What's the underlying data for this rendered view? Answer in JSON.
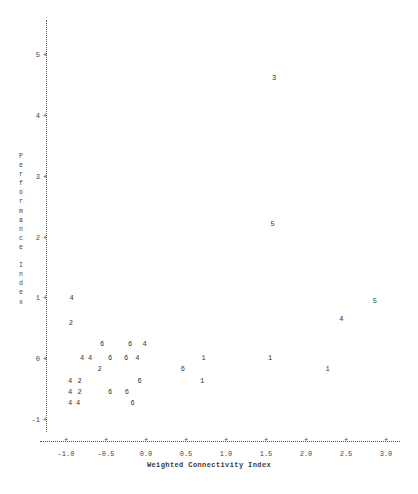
{
  "chart_data": {
    "type": "scatter",
    "title": "",
    "xlabel": "Weighted Connectivity Index",
    "ylabel": "Performance Index",
    "ylabel_chars": [
      "P",
      "e",
      "r",
      "f",
      "o",
      "r",
      "m",
      "a",
      "n",
      "c",
      "e",
      " ",
      "I",
      "n",
      "d",
      "e",
      "x"
    ],
    "xlim": [
      -1.25,
      3.15
    ],
    "ylim": [
      -1.35,
      5.55
    ],
    "xticks": [
      "-1.0",
      "-0.5",
      "0.0",
      "0.5",
      "1.0",
      "1.5",
      "2.0",
      "2.5",
      "3.0"
    ],
    "xtick_values": [
      -1.0,
      -0.5,
      0.0,
      0.5,
      1.0,
      1.5,
      2.0,
      2.5,
      3.0
    ],
    "yticks": [
      "5",
      "4",
      "3",
      "2",
      "1",
      "0",
      "-1"
    ],
    "ytick_values": [
      5,
      4,
      3,
      2,
      1,
      0,
      -1
    ],
    "tick_glyph": "+",
    "grid": false,
    "legend": null,
    "note": "Character-cell scatter plot; each plotted glyph is a digit giving the count of observations overplotted at that cell.",
    "points": [
      {
        "x": 1.6,
        "y": 4.62,
        "label": "3"
      },
      {
        "x": 1.58,
        "y": 2.22,
        "label": "5"
      },
      {
        "x": -0.93,
        "y": 1.01,
        "label": "4"
      },
      {
        "x": 2.86,
        "y": 0.95,
        "label": "5"
      },
      {
        "x": 2.44,
        "y": 0.66,
        "label": "4"
      },
      {
        "x": -0.94,
        "y": 0.6,
        "label": "2"
      },
      {
        "x": -0.55,
        "y": 0.25,
        "label": "6"
      },
      {
        "x": -0.2,
        "y": 0.25,
        "label": "6"
      },
      {
        "x": -0.02,
        "y": 0.25,
        "label": "4"
      },
      {
        "x": -0.8,
        "y": 0.02,
        "label": "4"
      },
      {
        "x": -0.7,
        "y": 0.02,
        "label": "4"
      },
      {
        "x": -0.45,
        "y": 0.02,
        "label": "6"
      },
      {
        "x": -0.25,
        "y": 0.02,
        "label": "6"
      },
      {
        "x": -0.11,
        "y": 0.02,
        "label": "4"
      },
      {
        "x": 0.72,
        "y": 0.02,
        "label": "1"
      },
      {
        "x": 1.55,
        "y": 0.02,
        "label": "1"
      },
      {
        "x": -0.58,
        "y": -0.16,
        "label": "2"
      },
      {
        "x": 0.46,
        "y": -0.16,
        "label": "6"
      },
      {
        "x": 2.27,
        "y": -0.16,
        "label": "1"
      },
      {
        "x": -0.95,
        "y": -0.36,
        "label": "4"
      },
      {
        "x": -0.83,
        "y": -0.36,
        "label": "2"
      },
      {
        "x": -0.08,
        "y": -0.36,
        "label": "6"
      },
      {
        "x": 0.7,
        "y": -0.36,
        "label": "1"
      },
      {
        "x": -0.95,
        "y": -0.54,
        "label": "4"
      },
      {
        "x": -0.83,
        "y": -0.54,
        "label": "2"
      },
      {
        "x": -0.45,
        "y": -0.54,
        "label": "6"
      },
      {
        "x": -0.24,
        "y": -0.54,
        "label": "6"
      },
      {
        "x": -0.95,
        "y": -0.72,
        "label": "4"
      },
      {
        "x": -0.85,
        "y": -0.72,
        "label": "4"
      },
      {
        "x": -0.17,
        "y": -0.72,
        "label": "6"
      }
    ]
  }
}
